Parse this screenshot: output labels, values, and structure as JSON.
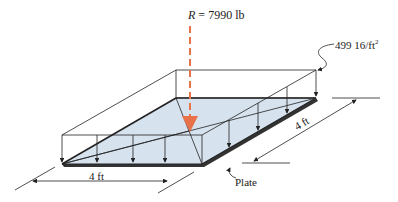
{
  "figure": {
    "resultant": {
      "symbol": "R",
      "equals": " = ",
      "value": "7990 lb"
    },
    "distributed_load": {
      "value": "499 16/ft",
      "exponent": "2"
    },
    "dimensions": {
      "bottom": "4 ft",
      "right": "4 ft"
    },
    "plate_label": "Plate",
    "colors": {
      "plate_fill": "#d6e2ee",
      "resultant_arrow": "#e8734a",
      "lines": "#222222"
    }
  }
}
